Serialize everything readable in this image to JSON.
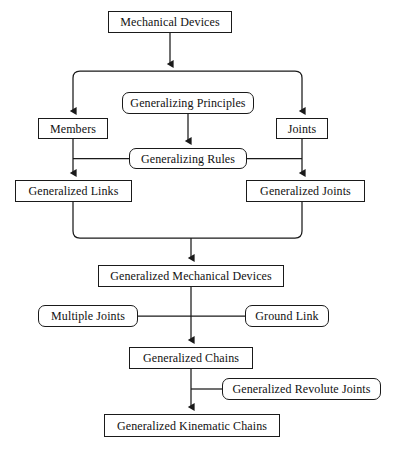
{
  "diagram": {
    "type": "flowchart",
    "orientation": "top-to-bottom",
    "canvas": {
      "width": 395,
      "height": 449
    },
    "style": {
      "background": "#ffffff",
      "line_color": "#1a1a1a",
      "text_color": "#111111",
      "box_fill": "#ffffff"
    },
    "nodes": [
      {
        "id": "mechanical_devices",
        "label": "Mechanical Devices",
        "shape": "rectangle",
        "x": 108,
        "y": 11,
        "w": 124,
        "h": 22,
        "font_size": 12
      },
      {
        "id": "generalizing_principles",
        "label": "Generalizing Principles",
        "shape": "rounded-rectangle",
        "x": 122,
        "y": 92,
        "w": 132,
        "h": 22,
        "font_size": 12
      },
      {
        "id": "members",
        "label": "Members",
        "shape": "rectangle",
        "x": 38,
        "y": 118,
        "w": 70,
        "h": 21,
        "font_size": 12
      },
      {
        "id": "joints",
        "label": "Joints",
        "shape": "rectangle",
        "x": 276,
        "y": 118,
        "w": 52,
        "h": 21,
        "font_size": 12
      },
      {
        "id": "generalizing_rules",
        "label": "Generalizing Rules",
        "shape": "rounded-rectangle",
        "x": 129,
        "y": 148,
        "w": 118,
        "h": 21,
        "font_size": 12
      },
      {
        "id": "generalized_links",
        "label": "Generalized Links",
        "shape": "rectangle",
        "x": 15,
        "y": 180,
        "w": 117,
        "h": 22,
        "font_size": 12
      },
      {
        "id": "generalized_joints",
        "label": "Generalized Joints",
        "shape": "rectangle",
        "x": 246,
        "y": 180,
        "w": 119,
        "h": 22,
        "font_size": 12
      },
      {
        "id": "generalized_mechanical_devices",
        "label": "Generalized Mechanical Devices",
        "shape": "rectangle",
        "x": 98,
        "y": 265,
        "w": 186,
        "h": 22,
        "font_size": 12
      },
      {
        "id": "multiple_joints",
        "label": "Multiple Joints",
        "shape": "rounded-rectangle",
        "x": 38,
        "y": 305,
        "w": 100,
        "h": 22,
        "font_size": 12
      },
      {
        "id": "ground_link",
        "label": "Ground Link",
        "shape": "rounded-rectangle",
        "x": 245,
        "y": 305,
        "w": 84,
        "h": 22,
        "font_size": 12
      },
      {
        "id": "generalized_chains",
        "label": "Generalized Chains",
        "shape": "rectangle",
        "x": 129,
        "y": 347,
        "w": 124,
        "h": 22,
        "font_size": 12
      },
      {
        "id": "generalized_revolute_joints",
        "label": "Generalized Revolute Joints",
        "shape": "rounded-rectangle",
        "x": 222,
        "y": 378,
        "w": 159,
        "h": 22,
        "font_size": 12
      },
      {
        "id": "generalized_kinematic_chains",
        "label": "Generalized Kinematic Chains",
        "shape": "rectangle",
        "x": 104,
        "y": 414,
        "w": 176,
        "h": 23,
        "font_size": 12
      }
    ],
    "edges": [
      {
        "id": "e-md-split",
        "from": "mechanical_devices",
        "to": "split-bus",
        "arrow": true,
        "style": "straight"
      },
      {
        "id": "e-split-members",
        "from": "split-bus",
        "to": "members",
        "arrow": true,
        "style": "elbow"
      },
      {
        "id": "e-split-joints",
        "from": "split-bus",
        "to": "joints",
        "arrow": true,
        "style": "elbow"
      },
      {
        "id": "e-gp-gr",
        "from": "generalizing_principles",
        "to": "generalizing_rules",
        "arrow": true,
        "style": "straight"
      },
      {
        "id": "e-gr-left",
        "from": "generalizing_rules",
        "to": "members-to-links-line",
        "arrow": false,
        "style": "horizontal"
      },
      {
        "id": "e-gr-right",
        "from": "generalizing_rules",
        "to": "joints-to-joints-line",
        "arrow": false,
        "style": "horizontal"
      },
      {
        "id": "e-members-gl",
        "from": "members",
        "to": "generalized_links",
        "arrow": true,
        "style": "straight"
      },
      {
        "id": "e-joints-gj",
        "from": "joints",
        "to": "generalized_joints",
        "arrow": true,
        "style": "straight"
      },
      {
        "id": "e-gl-merge",
        "from": "generalized_links",
        "to": "merge-bus",
        "arrow": false,
        "style": "elbow"
      },
      {
        "id": "e-gj-merge",
        "from": "generalized_joints",
        "to": "merge-bus",
        "arrow": false,
        "style": "elbow"
      },
      {
        "id": "e-merge-gmd",
        "from": "merge-bus",
        "to": "generalized_mechanical_devices",
        "arrow": true,
        "style": "straight"
      },
      {
        "id": "e-gmd-gc",
        "from": "generalized_mechanical_devices",
        "to": "generalized_chains",
        "arrow": true,
        "style": "straight"
      },
      {
        "id": "e-mj-spine",
        "from": "multiple_joints",
        "to": "gmd-to-gc-spine",
        "arrow": false,
        "style": "horizontal"
      },
      {
        "id": "e-gnd-spine",
        "from": "ground_link",
        "to": "gmd-to-gc-spine",
        "arrow": false,
        "style": "horizontal"
      },
      {
        "id": "e-gc-gkc",
        "from": "generalized_chains",
        "to": "generalized_kinematic_chains",
        "arrow": true,
        "style": "straight"
      },
      {
        "id": "e-grj-spine",
        "from": "generalized_revolute_joints",
        "to": "gc-to-gkc-spine",
        "arrow": false,
        "style": "horizontal"
      }
    ]
  }
}
